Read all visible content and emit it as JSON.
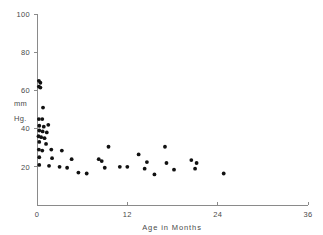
{
  "chart_data": {
    "type": "scatter",
    "title": "",
    "xlabel": "Age in Months",
    "ylabel": "mm Hg.",
    "ylabel_line1": "mm",
    "ylabel_line2": "Hg.",
    "xlim": [
      0,
      36
    ],
    "ylim": [
      0,
      100
    ],
    "xticks": [
      0,
      12,
      24,
      36
    ],
    "xtick_labels": [
      "0",
      "12",
      "24",
      "36"
    ],
    "yticks": [
      20,
      40,
      60,
      80,
      100
    ],
    "ytick_labels": [
      "20",
      "40",
      "60",
      "80",
      "100"
    ],
    "grid": false,
    "legend": null,
    "marker": "filled-circle",
    "marker_color": "#111111",
    "axis_color": "#8a8a8a",
    "points": [
      {
        "x": 0.25,
        "y": 65.0
      },
      {
        "x": 0.45,
        "y": 64.0
      },
      {
        "x": 0.25,
        "y": 62.0
      },
      {
        "x": 0.45,
        "y": 61.5
      },
      {
        "x": 0.8,
        "y": 51.0
      },
      {
        "x": 0.25,
        "y": 45.0
      },
      {
        "x": 0.7,
        "y": 45.0
      },
      {
        "x": 0.3,
        "y": 41.5
      },
      {
        "x": 0.9,
        "y": 41.0
      },
      {
        "x": 1.5,
        "y": 42.0
      },
      {
        "x": 0.3,
        "y": 39.0
      },
      {
        "x": 0.75,
        "y": 38.5
      },
      {
        "x": 1.3,
        "y": 38.0
      },
      {
        "x": 0.2,
        "y": 36.0
      },
      {
        "x": 0.55,
        "y": 35.5
      },
      {
        "x": 1.0,
        "y": 35.0
      },
      {
        "x": 0.3,
        "y": 33.0
      },
      {
        "x": 1.2,
        "y": 32.0
      },
      {
        "x": 0.25,
        "y": 29.0
      },
      {
        "x": 0.7,
        "y": 28.5
      },
      {
        "x": 1.9,
        "y": 29.0
      },
      {
        "x": 3.3,
        "y": 28.5
      },
      {
        "x": 0.3,
        "y": 25.0
      },
      {
        "x": 2.0,
        "y": 24.5
      },
      {
        "x": 4.6,
        "y": 24.0
      },
      {
        "x": 0.3,
        "y": 21.0
      },
      {
        "x": 1.6,
        "y": 20.5
      },
      {
        "x": 3.0,
        "y": 20.0
      },
      {
        "x": 4.0,
        "y": 19.5
      },
      {
        "x": 5.5,
        "y": 17.0
      },
      {
        "x": 6.6,
        "y": 16.5
      },
      {
        "x": 9.5,
        "y": 30.5
      },
      {
        "x": 8.2,
        "y": 24.0
      },
      {
        "x": 8.6,
        "y": 23.0
      },
      {
        "x": 9.0,
        "y": 19.5
      },
      {
        "x": 11.0,
        "y": 20.0
      },
      {
        "x": 12.0,
        "y": 20.0
      },
      {
        "x": 13.5,
        "y": 26.5
      },
      {
        "x": 14.6,
        "y": 22.5
      },
      {
        "x": 14.3,
        "y": 19.0
      },
      {
        "x": 15.6,
        "y": 16.0
      },
      {
        "x": 17.0,
        "y": 30.5
      },
      {
        "x": 17.2,
        "y": 22.0
      },
      {
        "x": 18.2,
        "y": 18.5
      },
      {
        "x": 20.5,
        "y": 23.5
      },
      {
        "x": 21.2,
        "y": 22.0
      },
      {
        "x": 21.0,
        "y": 19.0
      },
      {
        "x": 24.8,
        "y": 16.5
      }
    ]
  }
}
